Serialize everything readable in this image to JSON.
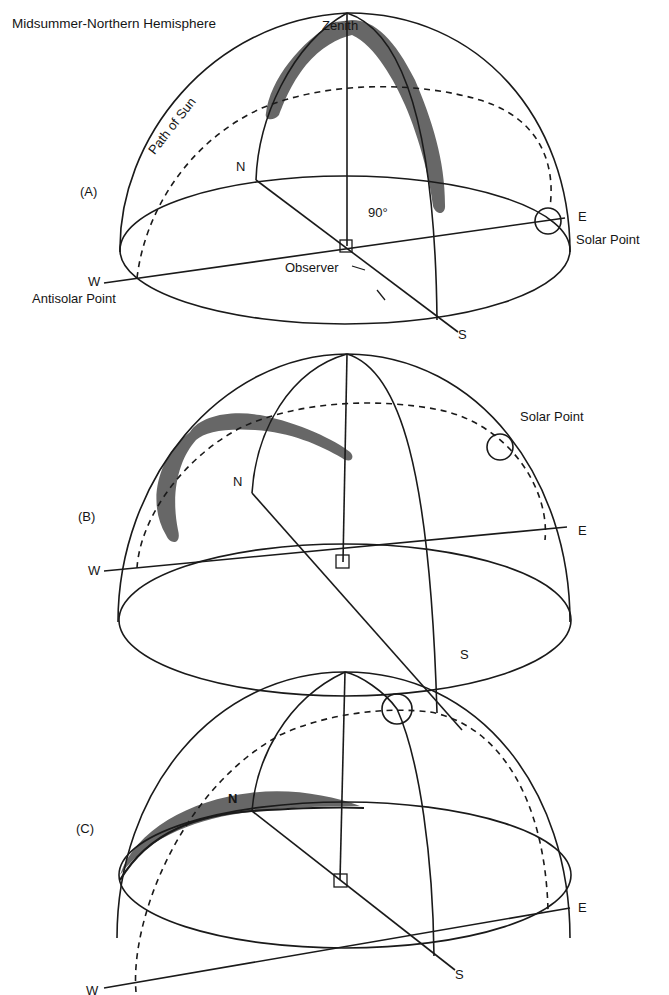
{
  "figure": {
    "title": "Midsummer-Northern Hemisphere",
    "panels": [
      {
        "id": "A",
        "label": "(A)",
        "zenith_label": "Zenith",
        "path_label": "Path of Sun",
        "angle_label": "90°",
        "observer_label": "Observer",
        "directions": {
          "north": "N",
          "south": "S",
          "east": "E",
          "west": "W"
        },
        "solar_point_label": "Solar Point",
        "antisolar_point_label": "Antisolar Point"
      },
      {
        "id": "B",
        "label": "(B)",
        "directions": {
          "north": "N",
          "south": "S",
          "east": "E",
          "west": "W"
        },
        "solar_point_label": "Solar Point"
      },
      {
        "id": "C",
        "label": "(C)",
        "directions": {
          "north": "N",
          "south": "S",
          "east": "E",
          "west": "W"
        }
      }
    ],
    "colors": {
      "line": "#1a1a1a",
      "polarization_band": "#5f5f5f",
      "background": "#ffffff"
    }
  }
}
